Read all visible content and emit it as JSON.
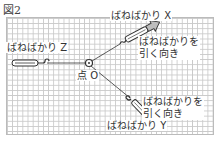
{
  "figure": {
    "title": "図2"
  },
  "labels": {
    "spring_z": "ばねばかり Z",
    "spring_x": "ばねばかり X",
    "spring_y": "ばねばかり Y",
    "point_o": "点 O",
    "pull_direction_x_line1": "ばねばかりを",
    "pull_direction_x_line2": "引く向き",
    "pull_direction_y_line1": "ばねばかりを",
    "pull_direction_y_line2": "引く向き"
  },
  "colors": {
    "grid_line": "#c9c9c9",
    "line": "#333333",
    "arrow_fill": "#bdbdbd"
  }
}
